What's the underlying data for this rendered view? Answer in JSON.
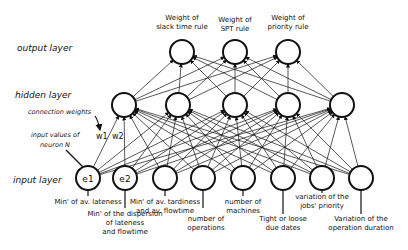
{
  "layers": {
    "output": "output layer",
    "hidden": "hidden layer",
    "input": "input layer"
  },
  "annotations": {
    "connection_weights": "connection weights",
    "input_values_1": "input values of",
    "input_values_2": "neuron N",
    "w1": "w1",
    "w2": "w2"
  },
  "output_nodes": [
    {
      "x": 182,
      "line1": "Weight of",
      "line2": "slack time rule"
    },
    {
      "x": 235,
      "line1": "Weight of",
      "line2": "SPT rule"
    },
    {
      "x": 288,
      "line1": "Weight of",
      "line2": "priority rule"
    }
  ],
  "hidden_nodes": [
    {
      "x": 124
    },
    {
      "x": 178
    },
    {
      "x": 235
    },
    {
      "x": 288
    },
    {
      "x": 342
    }
  ],
  "input_nodes": [
    {
      "x": 88,
      "name": "e1",
      "lines": [
        "Min' of av. lateness"
      ]
    },
    {
      "x": 125,
      "name": "e2",
      "lines": [
        "Min' of the dispersion",
        "of  lateness",
        "and flowtime"
      ]
    },
    {
      "x": 165,
      "name": "",
      "lines": [
        "Min' of av. tardiness",
        "and av. flowtime"
      ]
    },
    {
      "x": 203,
      "name": "",
      "lines": [
        "number of",
        "operations"
      ]
    },
    {
      "x": 243,
      "name": "",
      "lines": [
        "number of",
        "machines"
      ]
    },
    {
      "x": 283,
      "name": "",
      "lines": [
        "Tight or loose",
        "due dates"
      ]
    },
    {
      "x": 322,
      "name": "",
      "lines": [
        "variation of the",
        "jobs' priority"
      ]
    },
    {
      "x": 361,
      "name": "",
      "lines": [
        "Variation of the",
        "operation duration"
      ]
    }
  ]
}
